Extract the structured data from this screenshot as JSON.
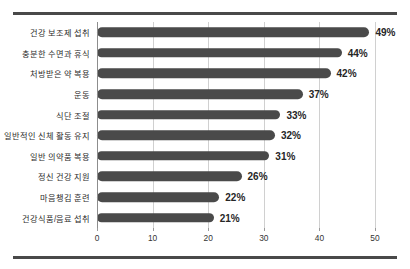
{
  "chart_data": {
    "type": "bar",
    "orientation": "horizontal",
    "title": "",
    "subtitle": "",
    "xlabel": "",
    "ylabel": "",
    "xlim": [
      0,
      50
    ],
    "xticks": [
      0,
      10,
      20,
      30,
      40,
      50
    ],
    "xtick_labels": [
      "0",
      "10",
      "20",
      "30",
      "40",
      "50"
    ],
    "grid": "vertical",
    "legend": "none",
    "bar_color": "#4a4a4a",
    "value_label_suffix": "%",
    "categories": [
      "건강 보조제 섭취",
      "충분한 수면과 휴식",
      "처방받은 약 복용",
      "운동",
      "식단 조절",
      "일반적인 신체 활동 유지",
      "일반 의약품 복용",
      "정신 건강 지원",
      "마음챙김 훈련",
      "건강식품/음료 섭취"
    ],
    "values": [
      49,
      44,
      42,
      37,
      33,
      32,
      31,
      26,
      22,
      21
    ],
    "value_labels": [
      "49%",
      "44%",
      "42%",
      "37%",
      "33%",
      "32%",
      "31%",
      "26%",
      "22%",
      "21%"
    ]
  }
}
